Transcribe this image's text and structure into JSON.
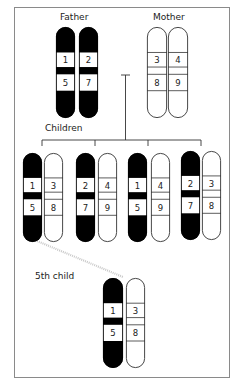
{
  "labels": {
    "father": "Father",
    "mother": "Mother",
    "children": "Children",
    "fifth_child": "5th child"
  },
  "colors": {
    "paternal": "#000000",
    "maternal": "#ffffff",
    "outline": "#333333",
    "frame": "#8a8a8a",
    "crossover_line": "#c8c8c8"
  },
  "parents": {
    "father": {
      "chromosomes": [
        {
          "upper": "1",
          "lower": "5",
          "type": "paternal"
        },
        {
          "upper": "2",
          "lower": "7",
          "type": "paternal"
        }
      ]
    },
    "mother": {
      "chromosomes": [
        {
          "upper": "3",
          "lower": "8",
          "type": "maternal"
        },
        {
          "upper": "4",
          "lower": "9",
          "type": "maternal"
        }
      ]
    }
  },
  "children": [
    {
      "paternal": {
        "upper": "1",
        "lower": "5"
      },
      "maternal": {
        "upper": "3",
        "lower": "8"
      }
    },
    {
      "paternal": {
        "upper": "2",
        "lower": "7"
      },
      "maternal": {
        "upper": "4",
        "lower": "9"
      }
    },
    {
      "paternal": {
        "upper": "1",
        "lower": "5"
      },
      "maternal": {
        "upper": "4",
        "lower": "9"
      }
    },
    {
      "paternal": {
        "upper": "2",
        "lower": "7"
      },
      "maternal": {
        "upper": "3",
        "lower": "8"
      }
    }
  ],
  "fifth_child": {
    "paternal": {
      "upper": "1",
      "lower": "5"
    },
    "maternal": {
      "upper": "3",
      "lower": "8"
    }
  }
}
